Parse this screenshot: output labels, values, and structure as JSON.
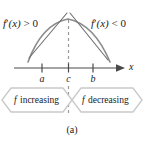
{
  "figure": {
    "caption": "(a)",
    "axis_label": "x",
    "curve": {
      "description": "concave-down curve with maximum at c"
    },
    "derivative_labels": {
      "left": {
        "fprime": "f",
        "prime": "′",
        "arg": "(x)",
        "relation": " > 0"
      },
      "right": {
        "fprime": "f",
        "prime": "′",
        "arg": "(x)",
        "relation": " < 0"
      }
    },
    "tick_labels": [
      "a",
      "c",
      "b"
    ],
    "banners": [
      {
        "f": "f",
        "text": " increasing"
      },
      {
        "f": "f",
        "text": " decreasing"
      }
    ],
    "colors": {
      "curve": "#8c8c8c",
      "tangent": "#6e6e6e",
      "axis": "#4a4a4a",
      "dashed": "#9a9a9a",
      "banner_stroke": "#c9c9c9",
      "text": "#222222",
      "background": "#ffffff"
    }
  }
}
